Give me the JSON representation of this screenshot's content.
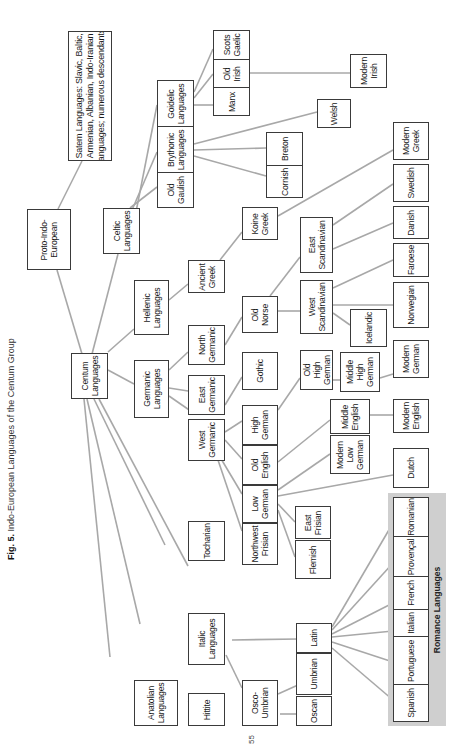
{
  "figure": {
    "label": "Fig. 5.",
    "caption": "Indo-European Languages of the Centum Group",
    "page_number": "55",
    "orientation": "rotated 90° counter-clockwise",
    "line_color": "#a8a8a8",
    "box_border_color": "#3a3a3a",
    "group_fill_color": "#cfcfcf"
  },
  "nodes": {
    "satem": "Satem Languages: Slavic, Baltic,\nArmenian, Albanian, Indo-Iranian\nlanguages; numerous descendants",
    "pie": "Proto-Indo-\nEuropean",
    "celtic": "Celtic\nLanguages",
    "old_gaulish": "Old\nGaulish",
    "brythonic": "Brythonic\nLanguages",
    "goidelic": "Goidelic\nLanguages",
    "scots_gaelic": "Scots\nGaelic",
    "old_irish": "Old\nIrish",
    "manx": "Manx",
    "modern_irish": "Modern\nIrish",
    "welsh": "Welsh",
    "breton": "Breton",
    "cornish": "Cornish",
    "centum": "Centum\nLanguages",
    "hellenic": "Hellenic\nLanguages",
    "ancient_greek": "Ancient\nGreek",
    "koine_greek": "Koine\nGreek",
    "modern_greek": "Modern\nGreek",
    "germanic": "Germanic\nLanguages",
    "north_germanic": "North\nGermanic",
    "east_germanic": "East\nGermanic",
    "west_germanic": "West\nGermanic",
    "old_norse": "Old\nNorse",
    "gothic": "Gothic",
    "east_scandinavian": "East\nScandinavian",
    "west_scandinavian": "West\nScandinavian",
    "swedish": "Swedish",
    "danish": "Danish",
    "faroese": "Faroese",
    "norwegian": "Norwegian",
    "icelandic": "Icelandic",
    "high_german": "High\nGerman",
    "old_english": "Old\nEnglish",
    "low_german": "Low\nGerman",
    "northwest_frisian": "Northwest\nFrisian",
    "old_high_german": "Old\nHigh\nGerman",
    "middle_high_german": "Middle\nHigh\nGerman",
    "modern_german": "Modern\nGerman",
    "middle_english": "Middle\nEnglish",
    "modern_english": "Modern\nEnglish",
    "modern_low_german": "Modern\nLow\nGerman",
    "dutch": "Dutch",
    "east_frisian": "East\nFrisian",
    "flemish": "Flemish",
    "tocharian": "Tocharian",
    "italic": "Italic\nLanguages",
    "osco_umbrian": "Osco-\nUmbrian",
    "oscan": "Oscan",
    "umbrian": "Umbrian",
    "latin": "Latin",
    "anatolian": "Anatolian\nLanguages",
    "hittite": "Hittite",
    "romanian": "Romanian",
    "provencal": "Provençal",
    "french": "French",
    "italian": "Italian",
    "portuguese": "Portuguese",
    "spanish": "Spanish"
  },
  "groups": {
    "romance": "Romance Languages"
  }
}
